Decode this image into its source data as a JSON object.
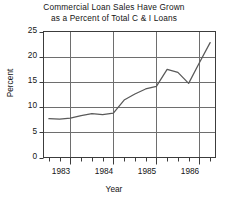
{
  "chart_data": {
    "type": "line",
    "title": "Commercial Loan Sales Have Grown as a Percent of Total C & I Loans",
    "title_lines": [
      "Commercial Loan Sales Have Grown",
      "as a Percent of Total C & I Loans"
    ],
    "xlabel": "Year",
    "ylabel": "Percent",
    "ylim": [
      0,
      25
    ],
    "xlim": [
      1982.875,
      1986.875
    ],
    "ytick_labels": [
      "0",
      "5",
      "10",
      "15",
      "20",
      "25"
    ],
    "ytick_values": [
      0,
      5,
      10,
      15,
      20,
      25
    ],
    "xtick_labels": [
      "1983",
      "1984",
      "1985",
      "1986"
    ],
    "xtick_values": [
      1983,
      1984,
      1985,
      1986
    ],
    "grid": "both",
    "legend": "none",
    "x": [
      1983.0,
      1983.25,
      1983.5,
      1983.75,
      1984.0,
      1984.25,
      1984.5,
      1984.75,
      1985.0,
      1985.25,
      1985.5,
      1985.75,
      1986.0,
      1986.25,
      1986.5,
      1986.75
    ],
    "x_quarter_labels": [
      "1983 Q1",
      "1983 Q2",
      "1983 Q3",
      "1983 Q4",
      "1984 Q1",
      "1984 Q2",
      "1984 Q3",
      "1984 Q4",
      "1985 Q1",
      "1985 Q2",
      "1985 Q3",
      "1985 Q4",
      "1986 Q1",
      "1986 Q2",
      "1986 Q3",
      "1986 Q4"
    ],
    "values": [
      7.7,
      7.6,
      7.8,
      8.3,
      8.7,
      8.5,
      8.8,
      11.4,
      12.6,
      13.6,
      14.1,
      17.5,
      16.9,
      14.7,
      18.8,
      22.8
    ],
    "series": [
      {
        "name": "Commercial loan sales as a percent of total C & I loans",
        "color": "#595959",
        "values": [
          7.7,
          7.6,
          7.8,
          8.3,
          8.7,
          8.5,
          8.8,
          11.4,
          12.6,
          13.6,
          14.1,
          17.5,
          16.9,
          14.7,
          18.8,
          22.8
        ]
      }
    ],
    "colors": {
      "line": "#595959",
      "grid": "#6e6e6e",
      "axis": "#3c3c3c",
      "background": "#ffffff",
      "text": "#141414"
    }
  }
}
